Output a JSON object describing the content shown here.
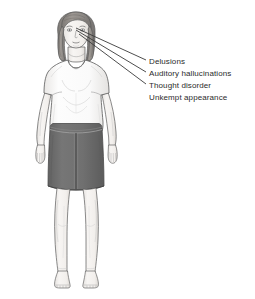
{
  "illustration": {
    "title": "Schizophrenia symptoms figure",
    "subject": "standing female figure, front view",
    "background_color": "#ffffff",
    "clothing": {
      "top": "short-sleeve white t-shirt",
      "top_color": "#fbfbfb",
      "skirt": "knee-length grey skirt with front zip",
      "skirt_color": "#6e6e6e",
      "waistband_color": "#8a8a8a"
    },
    "hair_color": "#8e8a86",
    "skin_color": "#f4f2f0",
    "outline_color": "#5a5a5a"
  },
  "callouts": {
    "line_color": "#3a3a3a",
    "anchor_region": "head",
    "items": [
      {
        "id": "delusions",
        "label": "Delusions",
        "has_leader_line": true,
        "anchor": {
          "x": 76,
          "y": 28
        },
        "target": {
          "x": 146,
          "y": 60
        }
      },
      {
        "id": "auditory-hallucinations",
        "label": "Auditory hallucinations",
        "has_leader_line": true,
        "anchor": {
          "x": 76,
          "y": 30
        },
        "target": {
          "x": 146,
          "y": 72
        }
      },
      {
        "id": "thought-disorder",
        "label": "Thought disorder",
        "has_leader_line": true,
        "anchor": {
          "x": 79,
          "y": 34
        },
        "target": {
          "x": 146,
          "y": 84
        }
      },
      {
        "id": "unkempt-appearance",
        "label": "Unkempt appearance",
        "has_leader_line": false,
        "anchor": null,
        "target": null
      }
    ]
  }
}
